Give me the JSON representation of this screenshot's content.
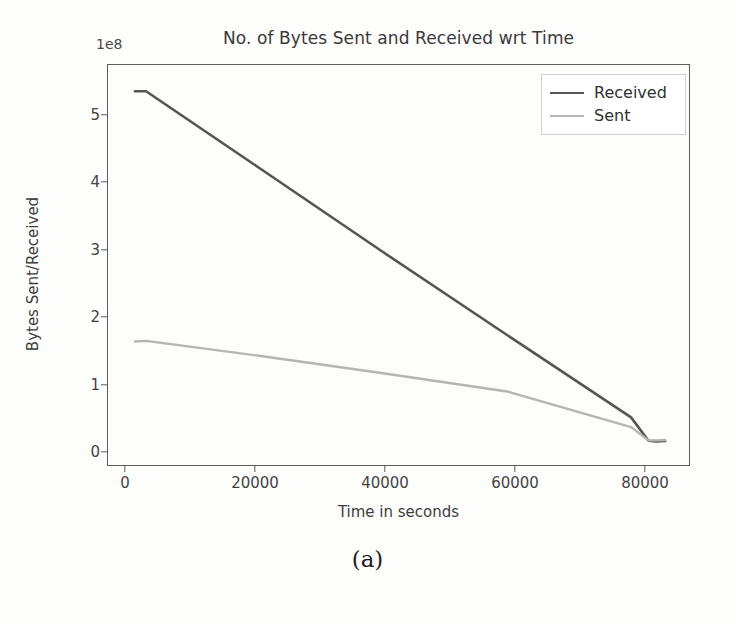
{
  "figure": {
    "caption": "(a)"
  },
  "chart_data": {
    "type": "line",
    "title": "No. of Bytes Sent and Received wrt Time",
    "xlabel": "Time in seconds",
    "ylabel": "Bytes Sent/Received",
    "y_offset_label": "1e8",
    "xlim": [
      -4500,
      89500
    ],
    "ylim": [
      -30000000,
      590000000
    ],
    "xticks": [
      0,
      20000,
      40000,
      60000,
      80000
    ],
    "xtick_labels": [
      "0",
      "20000",
      "40000",
      "60000",
      "80000"
    ],
    "yticks": [
      0,
      100000000,
      200000000,
      300000000,
      400000000,
      500000000
    ],
    "ytick_labels": [
      "0",
      "1",
      "2",
      "3",
      "4",
      "5"
    ],
    "grid": false,
    "legend_position": "upper right",
    "series": [
      {
        "name": "Received",
        "color": "#555555",
        "x": [
          0,
          1800,
          20000,
          40000,
          60000,
          80000,
          82800,
          84000,
          85500
        ],
        "y": [
          548000000,
          548000000,
          430000000,
          300000000,
          172000000,
          45000000,
          9000000,
          8000000,
          8500000
        ]
      },
      {
        "name": "Sent",
        "color": "#b5b5b5",
        "x": [
          0,
          1800,
          20000,
          40000,
          60000,
          80000,
          82800,
          84000,
          85500
        ],
        "y": [
          162000000,
          163000000,
          140000000,
          113000000,
          85000000,
          30000000,
          9500000,
          9500000,
          10000000
        ]
      }
    ]
  },
  "legend": {
    "items": [
      {
        "label": "Received",
        "color": "#555555"
      },
      {
        "label": "Sent",
        "color": "#b5b5b5"
      }
    ]
  }
}
